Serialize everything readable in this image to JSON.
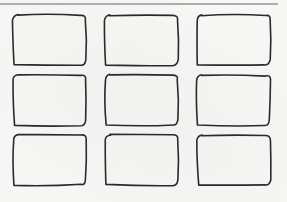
{
  "sketch": {
    "type": "hand-drawn wireframe grid",
    "rows": 3,
    "columns": 3,
    "ink_color": "#2a2a2a",
    "paper_color": "#f7f7f5",
    "rule_color": "#666666",
    "top_rule": {
      "x1": 0,
      "x2": 278,
      "y": 4
    },
    "boxes": [
      {
        "row": 1,
        "col": 1,
        "x": 13,
        "y": 15,
        "w": 73,
        "h": 50
      },
      {
        "row": 1,
        "col": 2,
        "x": 105,
        "y": 15,
        "w": 73,
        "h": 50
      },
      {
        "row": 1,
        "col": 3,
        "x": 197,
        "y": 15,
        "w": 73,
        "h": 50
      },
      {
        "row": 2,
        "col": 1,
        "x": 13,
        "y": 75,
        "w": 73,
        "h": 50
      },
      {
        "row": 2,
        "col": 2,
        "x": 105,
        "y": 75,
        "w": 73,
        "h": 50
      },
      {
        "row": 2,
        "col": 3,
        "x": 197,
        "y": 75,
        "w": 73,
        "h": 50
      },
      {
        "row": 3,
        "col": 1,
        "x": 13,
        "y": 135,
        "w": 73,
        "h": 50
      },
      {
        "row": 3,
        "col": 2,
        "x": 105,
        "y": 135,
        "w": 73,
        "h": 50
      },
      {
        "row": 3,
        "col": 3,
        "x": 197,
        "y": 135,
        "w": 73,
        "h": 50
      }
    ]
  }
}
